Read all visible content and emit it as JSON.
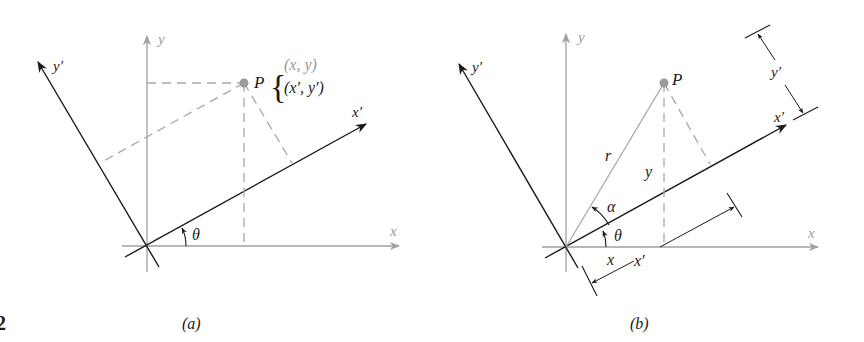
{
  "figure": {
    "number_fragment": "2",
    "colors": {
      "axis_dark": "#1a1a1a",
      "axis_gray": "#9a9a9a",
      "dashed": "#a8a8a8",
      "point": "#9a9a9a"
    }
  },
  "panel_a": {
    "caption": "(a)",
    "caption_letter": "a",
    "labels": {
      "x_axis": "x",
      "y_axis": "y",
      "x_prime_axis": "x′",
      "y_prime_axis": "y′",
      "angle": "θ",
      "point": "P",
      "coords_original": "(x, y)",
      "coords_rotated": "(x′, y′)",
      "brace": "{"
    }
  },
  "panel_b": {
    "caption": "(b)",
    "caption_letter": "b",
    "labels": {
      "x_axis": "x",
      "y_axis": "y",
      "x_prime_axis": "x′",
      "y_prime_axis": "y′",
      "angle_theta": "θ",
      "angle_alpha": "α",
      "point": "P",
      "radius": "r",
      "y_distance": "y",
      "x_distance": "x",
      "x_prime_distance": "x′",
      "y_prime_distance": "y′"
    }
  }
}
